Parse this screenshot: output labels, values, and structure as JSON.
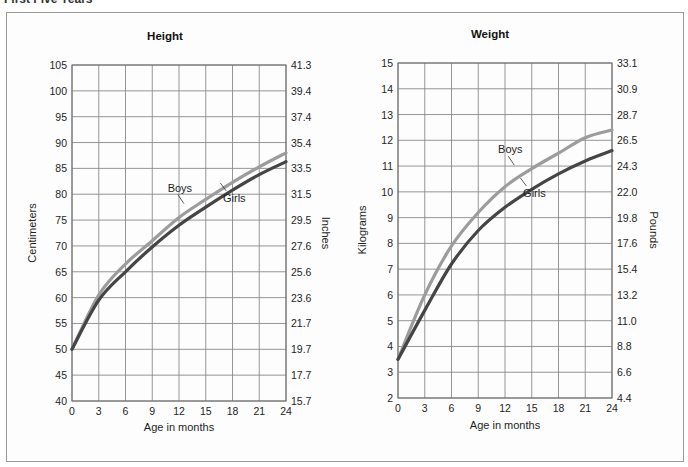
{
  "page": {
    "heading": "First Five Years"
  },
  "chart_data": [
    {
      "type": "line",
      "title": "Height",
      "xlabel": "Age in months",
      "ylabel": "Centimeters",
      "ylabel_right": "Inches",
      "x": [
        0,
        3,
        6,
        9,
        12,
        15,
        18,
        21,
        24
      ],
      "xticks": [
        "0",
        "3",
        "6",
        "9",
        "12",
        "15",
        "18",
        "21",
        "24"
      ],
      "xlim": [
        0,
        24
      ],
      "ylim": [
        40,
        105
      ],
      "yticks": [
        "40",
        "45",
        "50",
        "55",
        "60",
        "65",
        "70",
        "75",
        "80",
        "85",
        "90",
        "95",
        "100",
        "105"
      ],
      "yticks_right": [
        "15.7",
        "17.7",
        "19.7",
        "21.7",
        "23.6",
        "25.6",
        "27.6",
        "29.5",
        "31.5",
        "33.5",
        "35.4",
        "37.4",
        "39.4",
        "41.3"
      ],
      "grid": true,
      "series": [
        {
          "name": "Boys",
          "color": "#9c9c9c",
          "values": [
            50,
            60.5,
            66.5,
            71,
            75.5,
            79,
            82.3,
            85.3,
            88
          ]
        },
        {
          "name": "Girls",
          "color": "#454545",
          "values": [
            50,
            59.5,
            65,
            69.8,
            74,
            77.5,
            80.8,
            83.8,
            86.3
          ]
        }
      ],
      "annotations": [
        {
          "text": "Boys",
          "x": 12.1,
          "y": 80.5
        },
        {
          "text": "Girls",
          "x": 18.2,
          "y": 78.5
        }
      ]
    },
    {
      "type": "line",
      "title": "Weight",
      "xlabel": "Age in months",
      "ylabel": "Kilograms",
      "ylabel_right": "Pounds",
      "x": [
        0,
        3,
        6,
        9,
        12,
        15,
        18,
        21,
        24
      ],
      "xticks": [
        "0",
        "3",
        "6",
        "9",
        "12",
        "15",
        "18",
        "21",
        "24"
      ],
      "xlim": [
        0,
        24
      ],
      "ylim": [
        2,
        15
      ],
      "yticks": [
        "2",
        "3",
        "4",
        "5",
        "6",
        "7",
        "8",
        "9",
        "10",
        "11",
        "12",
        "13",
        "14",
        "15"
      ],
      "yticks_right": [
        "4.4",
        "6.6",
        "8.8",
        "11.0",
        "13.2",
        "15.4",
        "17.6",
        "19.8",
        "22.0",
        "24.3",
        "26.5",
        "28.7",
        "30.9",
        "33.1"
      ],
      "grid": true,
      "series": [
        {
          "name": "Boys",
          "color": "#9c9c9c",
          "values": [
            3.5,
            6.0,
            7.9,
            9.2,
            10.2,
            10.9,
            11.5,
            12.1,
            12.4
          ]
        },
        {
          "name": "Girls",
          "color": "#454545",
          "values": [
            3.5,
            5.4,
            7.2,
            8.5,
            9.4,
            10.1,
            10.7,
            11.2,
            11.6
          ]
        }
      ],
      "annotations": [
        {
          "text": "Boys",
          "x": 12.6,
          "y": 11.5
        },
        {
          "text": "Girls",
          "x": 15.3,
          "y": 9.8
        }
      ]
    }
  ]
}
